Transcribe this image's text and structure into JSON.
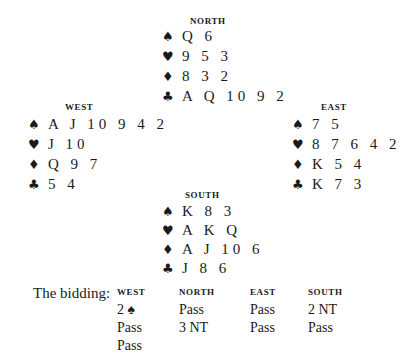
{
  "hands": {
    "north": {
      "label": "NORTH",
      "spades": "Q 6",
      "hearts": "9 5 3",
      "diamonds": "8 3 2",
      "clubs": "A Q 10 9 2"
    },
    "west": {
      "label": "WEST",
      "spades": "A J 10 9 4 2",
      "hearts": "J 10",
      "diamonds": "Q 9 7",
      "clubs": "5 4"
    },
    "east": {
      "label": "EAST",
      "spades": "7 5",
      "hearts": "8 7 6 4 2",
      "diamonds": "K 5 4",
      "clubs": "K 7 3"
    },
    "south": {
      "label": "SOUTH",
      "spades": "K 8 3",
      "hearts": "A K Q",
      "diamonds": "A J 10 6",
      "clubs": "J 8 6"
    }
  },
  "suit_icons": {
    "spades": "♠",
    "hearts": "♥",
    "diamonds": "♦",
    "clubs": "♣"
  },
  "bidding": {
    "title": "The bidding:",
    "columns": [
      {
        "label": "WEST",
        "bids": [
          "2 ♠",
          "Pass",
          "Pass"
        ]
      },
      {
        "label": "NORTH",
        "bids": [
          "Pass",
          "3 NT"
        ]
      },
      {
        "label": "EAST",
        "bids": [
          "Pass",
          "Pass"
        ]
      },
      {
        "label": "SOUTH",
        "bids": [
          "2 NT",
          "Pass"
        ]
      }
    ]
  }
}
